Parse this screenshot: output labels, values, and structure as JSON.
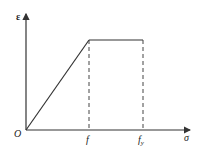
{
  "diagram": {
    "type": "stress-strain-like piecewise linear curve",
    "y_axis_label": "ε",
    "x_axis_label": "σ",
    "origin_label": "O",
    "x_tick_labels": [
      "f",
      "f_y"
    ],
    "x_tick_label_f": "f",
    "x_tick_label_fy_base": "f",
    "x_tick_label_fy_sub": "y",
    "segments": [
      {
        "from": "O",
        "to": "(f, plateau)",
        "style": "solid"
      },
      {
        "from": "(f, plateau)",
        "to": "(f_y, plateau)",
        "style": "solid"
      },
      {
        "from": "(f, plateau)",
        "to": "(f, 0)",
        "style": "dashed"
      },
      {
        "from": "(f_y, plateau)",
        "to": "(f_y, 0)",
        "style": "dashed"
      }
    ],
    "line_color": "#333333"
  }
}
